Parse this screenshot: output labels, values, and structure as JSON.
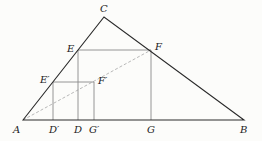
{
  "diagram": {
    "colors": {
      "background": "#fcfcfa",
      "triangle": "#2a2a2a",
      "square": "#8a8a8a",
      "dashed": "#b0b0b0",
      "label": "#222222"
    },
    "points": {
      "A": {
        "label": "A",
        "x": 23,
        "y": 120
      },
      "B": {
        "label": "B",
        "x": 244,
        "y": 120
      },
      "C": {
        "label": "C",
        "x": 104,
        "y": 17
      },
      "E": {
        "label": "E",
        "x": 78,
        "y": 50
      },
      "F": {
        "label": "F",
        "x": 151,
        "y": 50
      },
      "D": {
        "label": "D",
        "x": 78,
        "y": 120
      },
      "G": {
        "label": "G",
        "x": 151,
        "y": 120
      },
      "E_prime": {
        "label": "E′",
        "x": 53,
        "y": 82
      },
      "F_prime": {
        "label": "F′",
        "x": 94,
        "y": 82
      },
      "D_prime": {
        "label": "D′",
        "x": 53,
        "y": 120
      },
      "G_prime": {
        "label": "G′",
        "x": 94,
        "y": 120
      }
    }
  }
}
